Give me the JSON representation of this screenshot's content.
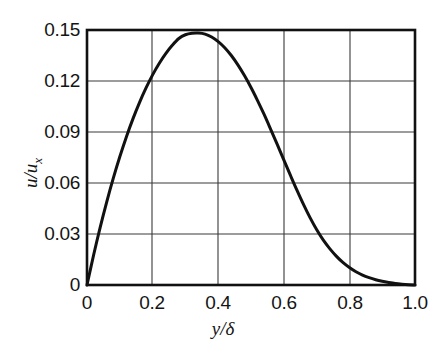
{
  "chart_data": {
    "type": "line",
    "title": "",
    "subtitle": "",
    "xlabel": "y/δ",
    "ylabel": "u/u",
    "ylabel_sub": "x",
    "xlim": [
      0,
      1.0
    ],
    "ylim": [
      0,
      0.15
    ],
    "grid": true,
    "legend": null,
    "xticks": [
      "0",
      "0.2",
      "0.4",
      "0.6",
      "0.8",
      "1.0"
    ],
    "xtick_values": [
      0,
      0.2,
      0.4,
      0.6,
      0.8,
      1.0
    ],
    "yticks": [
      "0",
      "0.03",
      "0.06",
      "0.09",
      "0.12",
      "0.15"
    ],
    "ytick_values": [
      0,
      0.03,
      0.06,
      0.09,
      0.12,
      0.15
    ],
    "series": [
      {
        "name": "velocity-profile",
        "color": "#111111",
        "linewidth": 3,
        "x": [
          0.0,
          0.02,
          0.04,
          0.06,
          0.08,
          0.1,
          0.12,
          0.14,
          0.16,
          0.18,
          0.2,
          0.22,
          0.24,
          0.26,
          0.28,
          0.3,
          0.32,
          0.34,
          0.36,
          0.38,
          0.4,
          0.42,
          0.44,
          0.46,
          0.48,
          0.5,
          0.52,
          0.54,
          0.56,
          0.58,
          0.6,
          0.62,
          0.64,
          0.66,
          0.68,
          0.7,
          0.72,
          0.74,
          0.76,
          0.78,
          0.8,
          0.82,
          0.84,
          0.86,
          0.88,
          0.9,
          0.92,
          0.94,
          0.96,
          0.98,
          1.0
        ],
        "y": [
          0.0,
          0.0175,
          0.0338,
          0.0488,
          0.0627,
          0.0754,
          0.0871,
          0.0977,
          0.1073,
          0.1159,
          0.1236,
          0.1303,
          0.1361,
          0.141,
          0.145,
          0.1472,
          0.1481,
          0.1482,
          0.1476,
          0.1459,
          0.1432,
          0.1396,
          0.135,
          0.1295,
          0.1232,
          0.1162,
          0.1085,
          0.1003,
          0.0916,
          0.0827,
          0.0736,
          0.0646,
          0.0558,
          0.0474,
          0.0396,
          0.0326,
          0.0265,
          0.0214,
          0.017,
          0.0133,
          0.0103,
          0.0078,
          0.0058,
          0.0043,
          0.0031,
          0.0022,
          0.0015,
          0.0009,
          0.0005,
          0.0002,
          0.0
        ]
      }
    ],
    "annotations": {
      "peak_x": 0.33,
      "peak_y": 0.148,
      "zero_crossings": [
        0.0,
        1.0
      ]
    },
    "colors": {
      "background": "#ffffff",
      "frame": "#111111",
      "grid": "#3a3a3a",
      "text": "#141414"
    }
  }
}
